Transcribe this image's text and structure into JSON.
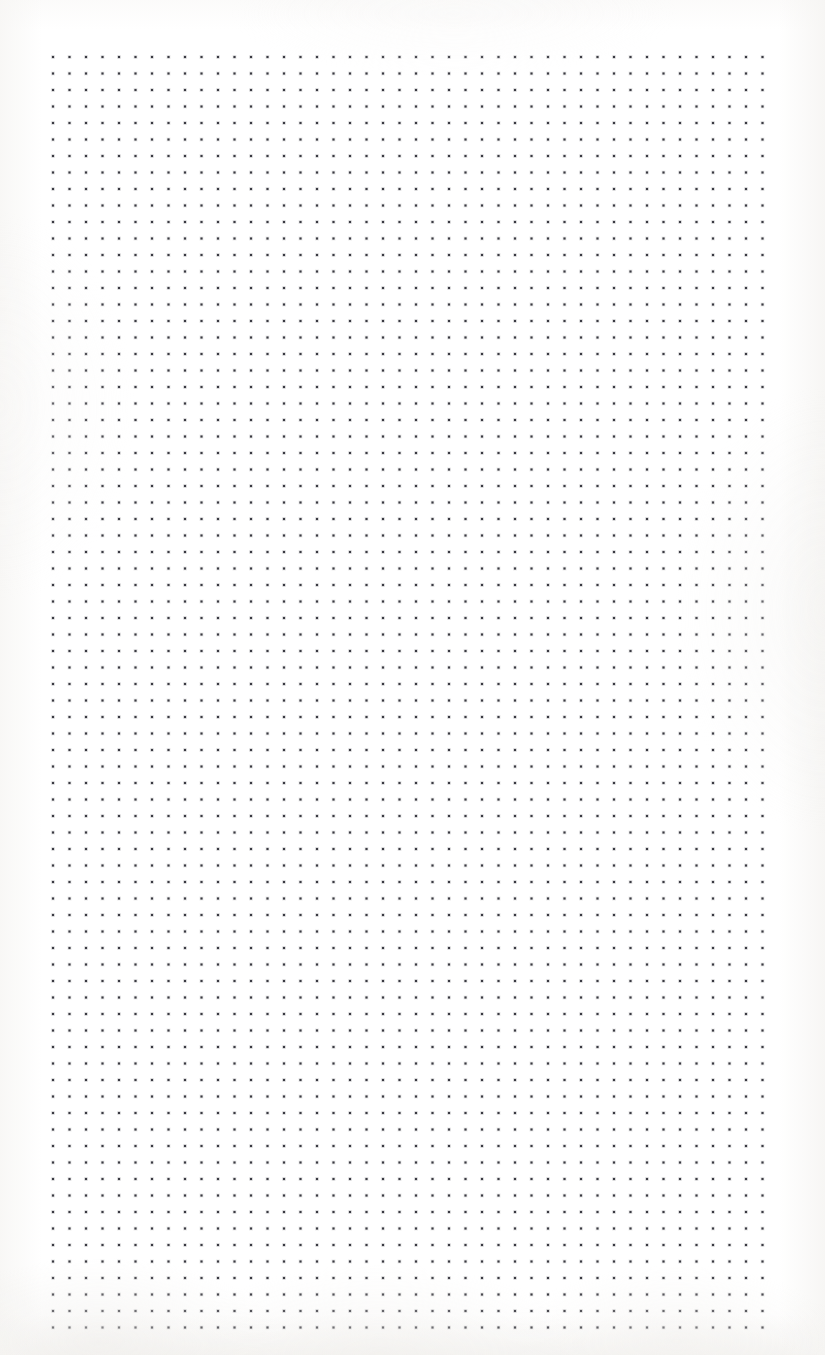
{
  "document": {
    "type": "dot-grid-page",
    "description": "Blank bullet-journal style dotted grid page",
    "page_width": 825,
    "page_height": 1355,
    "paper_color": "#ffffff",
    "edge_tint_color": "#f4f3f1",
    "visible_text": []
  },
  "grid": {
    "dot_color": "#3a3a42",
    "dot_size": 2.2,
    "pitch_x": 16.5,
    "pitch_y": 16.5,
    "origin_x": 53,
    "origin_y": 57,
    "columns": 44,
    "rows": 78,
    "right_edge": 773,
    "bottom_edge": 1325,
    "margin_left": 53,
    "margin_top": 57,
    "margin_right": 52,
    "margin_bottom": 30
  }
}
